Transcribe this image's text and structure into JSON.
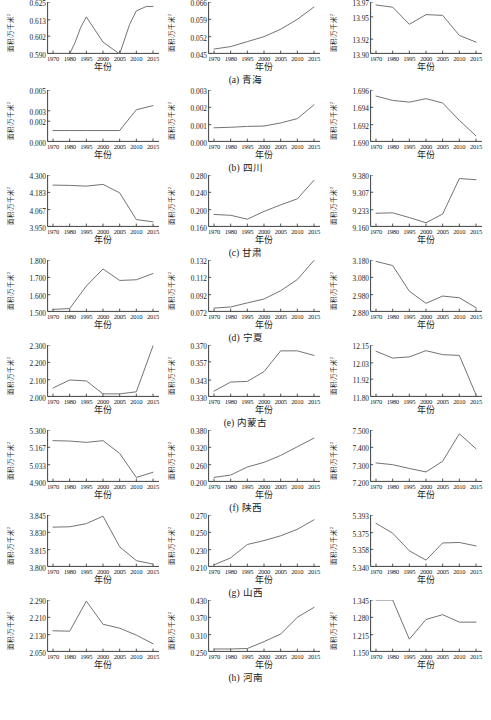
{
  "figure": {
    "axis_label_y": "面积/万千米",
    "axis_label_y_sup": "2",
    "axis_label_x": "年份",
    "line_color": "#6b6b6b",
    "axis_color": "#2b2b2b"
  },
  "chart_data": [
    {
      "type": "line",
      "panel": "a1",
      "row_caption": "(a) 青海",
      "title": "",
      "xlabel": "年份",
      "ylabel": "面积/万千米²",
      "xticks": [
        1970,
        1980,
        1995,
        2000,
        2005,
        2010,
        2015
      ],
      "yticks": [
        0.59,
        0.602,
        0.613,
        0.625
      ],
      "ytick_labels": [
        "0.590",
        "0.602",
        "0.613",
        "0.625"
      ],
      "ylim": [
        0.59,
        0.625
      ],
      "x": [
        1970,
        1980,
        1985,
        1990,
        1995,
        2000,
        2005,
        2008,
        2010,
        2013,
        2015
      ],
      "values": [
        0.59,
        0.59,
        0.598,
        0.608,
        0.615,
        0.598,
        0.59,
        0.61,
        0.619,
        0.622,
        0.622
      ]
    },
    {
      "type": "line",
      "panel": "a2",
      "row_caption": "(a) 青海",
      "title": "",
      "xlabel": "年份",
      "ylabel": "面积/万千米²",
      "xticks": [
        1970,
        1980,
        1995,
        2000,
        2005,
        2010,
        2015
      ],
      "yticks": [
        0.045,
        0.052,
        0.059,
        0.066
      ],
      "ytick_labels": [
        "0.045",
        "0.052",
        "0.059",
        "0.066"
      ],
      "ylim": [
        0.045,
        0.066
      ],
      "x": [
        1970,
        1980,
        1995,
        2000,
        2005,
        2010,
        2015
      ],
      "values": [
        0.047,
        0.048,
        0.05,
        0.052,
        0.055,
        0.059,
        0.064
      ]
    },
    {
      "type": "line",
      "panel": "a3",
      "row_caption": "(a) 青海",
      "title": "",
      "xlabel": "年份",
      "ylabel": "面积/万千米²",
      "xticks": [
        1970,
        1980,
        1995,
        2000,
        2005,
        2010,
        2015
      ],
      "yticks": [
        13.9,
        13.92,
        13.95,
        13.97
      ],
      "ytick_labels": [
        "13.90",
        "13.92",
        "13.95",
        "13.97"
      ],
      "ylim": [
        13.9,
        13.97
      ],
      "x": [
        1970,
        1980,
        1995,
        2000,
        2005,
        2010,
        2015
      ],
      "values": [
        13.966,
        13.963,
        13.94,
        13.953,
        13.952,
        13.925,
        13.916
      ]
    },
    {
      "type": "line",
      "panel": "b1",
      "row_caption": "(b) 四川",
      "title": "",
      "xlabel": "年份",
      "ylabel": "面积/万千米²",
      "xticks": [
        1970,
        1980,
        1995,
        2000,
        2005,
        2010,
        2015
      ],
      "yticks": [
        0.0,
        0.002,
        0.003,
        0.005
      ],
      "ytick_labels": [
        "0.000",
        "0.002",
        "0.003",
        "0.005"
      ],
      "ylim": [
        0.0,
        0.005
      ],
      "x": [
        1970,
        1980,
        1995,
        2000,
        2005,
        2010,
        2015
      ],
      "values": [
        0.0011,
        0.0011,
        0.0011,
        0.0011,
        0.0011,
        0.0031,
        0.0035
      ]
    },
    {
      "type": "line",
      "panel": "b2",
      "row_caption": "(b) 四川",
      "title": "",
      "xlabel": "年份",
      "ylabel": "面积/万千米²",
      "xticks": [
        1970,
        1980,
        1995,
        2000,
        2005,
        2010,
        2015
      ],
      "yticks": [
        0.0,
        0.001,
        0.002,
        0.003
      ],
      "ytick_labels": [
        "0.000",
        "0.001",
        "0.002",
        "0.003"
      ],
      "ylim": [
        0.0,
        0.003
      ],
      "x": [
        1970,
        1980,
        1995,
        2000,
        2005,
        2010,
        2015
      ],
      "values": [
        0.00082,
        0.00085,
        0.0009,
        0.00092,
        0.0011,
        0.00135,
        0.00215
      ]
    },
    {
      "type": "line",
      "panel": "b3",
      "row_caption": "(b) 四川",
      "title": "",
      "xlabel": "年份",
      "ylabel": "面积/万千米²",
      "xticks": [
        1970,
        1980,
        1995,
        2000,
        2005,
        2010,
        2015
      ],
      "yticks": [
        1.69,
        1.692,
        1.694,
        1.696
      ],
      "ytick_labels": [
        "1.690",
        "1.692",
        "1.694",
        "1.696"
      ],
      "ylim": [
        1.69,
        1.696
      ],
      "x": [
        1970,
        1980,
        1995,
        2000,
        2005,
        2010,
        2015
      ],
      "values": [
        1.6953,
        1.6948,
        1.6946,
        1.695,
        1.6945,
        1.6925,
        1.6907
      ]
    },
    {
      "type": "line",
      "panel": "c1",
      "row_caption": "(c) 甘肃",
      "title": "",
      "xlabel": "年份",
      "ylabel": "面积/万千米²",
      "xticks": [
        1970,
        1980,
        1995,
        2000,
        2005,
        2010,
        2015
      ],
      "yticks": [
        3.95,
        4.067,
        4.183,
        4.3
      ],
      "ytick_labels": [
        "3.950",
        "4.067",
        "4.183",
        "4.300"
      ],
      "ylim": [
        3.95,
        4.3
      ],
      "x": [
        1970,
        1980,
        1995,
        2000,
        2005,
        2010,
        2015
      ],
      "values": [
        4.232,
        4.23,
        4.225,
        4.237,
        4.18,
        4.0,
        3.985
      ]
    },
    {
      "type": "line",
      "panel": "c2",
      "row_caption": "(c) 甘肃",
      "title": "",
      "xlabel": "年份",
      "ylabel": "面积/万千米²",
      "xticks": [
        1970,
        1980,
        1995,
        2000,
        2005,
        2010,
        2015
      ],
      "yticks": [
        0.16,
        0.2,
        0.24,
        0.28
      ],
      "ytick_labels": [
        "0.160",
        "0.200",
        "0.240",
        "0.280"
      ],
      "ylim": [
        0.16,
        0.28
      ],
      "x": [
        1970,
        1980,
        1995,
        2000,
        2005,
        2010,
        2015
      ],
      "values": [
        0.189,
        0.187,
        0.178,
        0.196,
        0.211,
        0.225,
        0.268
      ]
    },
    {
      "type": "line",
      "panel": "c3",
      "row_caption": "(c) 甘肃",
      "title": "",
      "xlabel": "年份",
      "ylabel": "面积/万千米²",
      "xticks": [
        1970,
        1980,
        1995,
        2000,
        2005,
        2010,
        2015
      ],
      "yticks": [
        9.16,
        9.233,
        9.307,
        9.38
      ],
      "ytick_labels": [
        "9.160",
        "9.233",
        "9.307",
        "9.380"
      ],
      "ylim": [
        9.16,
        9.38
      ],
      "x": [
        1970,
        1980,
        1995,
        2000,
        2005,
        2010,
        2015
      ],
      "values": [
        9.218,
        9.22,
        9.2,
        9.178,
        9.215,
        9.365,
        9.36
      ]
    },
    {
      "type": "line",
      "panel": "d1",
      "row_caption": "(d) 宁夏",
      "title": "",
      "xlabel": "年份",
      "ylabel": "面积/万千米²",
      "xticks": [
        1970,
        1980,
        1995,
        2000,
        2005,
        2010,
        2015
      ],
      "yticks": [
        1.5,
        1.6,
        1.7,
        1.8
      ],
      "ytick_labels": [
        "1.500",
        "1.600",
        "1.700",
        "1.800"
      ],
      "ylim": [
        1.5,
        1.8
      ],
      "x": [
        1970,
        1980,
        1995,
        2000,
        2005,
        2010,
        2015
      ],
      "values": [
        1.515,
        1.52,
        1.65,
        1.748,
        1.682,
        1.686,
        1.722
      ]
    },
    {
      "type": "line",
      "panel": "d2",
      "row_caption": "(d) 宁夏",
      "title": "",
      "xlabel": "年份",
      "ylabel": "面积/万千米²",
      "xticks": [
        1970,
        1980,
        1995,
        2000,
        2005,
        2010,
        2015
      ],
      "yticks": [
        0.072,
        0.092,
        0.112,
        0.132
      ],
      "ytick_labels": [
        "0.072",
        "0.092",
        "0.112",
        "0.132"
      ],
      "ylim": [
        0.072,
        0.132
      ],
      "x": [
        1970,
        1980,
        1995,
        2000,
        2005,
        2010,
        2015
      ],
      "values": [
        0.0765,
        0.0778,
        0.0825,
        0.087,
        0.0965,
        0.1095,
        0.1315
      ]
    },
    {
      "type": "line",
      "panel": "d3",
      "row_caption": "(d) 宁夏",
      "title": "",
      "xlabel": "年份",
      "ylabel": "面积/万千米²",
      "xticks": [
        1970,
        1980,
        1995,
        2000,
        2005,
        2010,
        2015
      ],
      "yticks": [
        2.88,
        2.98,
        3.08,
        3.18
      ],
      "ytick_labels": [
        "2.880",
        "2.980",
        "3.080",
        "3.180"
      ],
      "ylim": [
        2.88,
        3.18
      ],
      "x": [
        1970,
        1980,
        1995,
        2000,
        2005,
        2010,
        2015
      ],
      "values": [
        3.172,
        3.148,
        3.0,
        2.93,
        2.972,
        2.962,
        2.905
      ]
    },
    {
      "type": "line",
      "panel": "e1",
      "row_caption": "(e) 内蒙古",
      "title": "",
      "xlabel": "年份",
      "ylabel": "面积/万千米²",
      "xticks": [
        1970,
        1980,
        1995,
        2000,
        2005,
        2010,
        2015
      ],
      "yticks": [
        2.0,
        2.1,
        2.2,
        2.3
      ],
      "ytick_labels": [
        "2.000",
        "2.100",
        "2.200",
        "2.300"
      ],
      "ylim": [
        2.0,
        2.3
      ],
      "x": [
        1970,
        1980,
        1995,
        2000,
        2005,
        2010,
        2015
      ],
      "values": [
        2.052,
        2.098,
        2.093,
        2.018,
        2.018,
        2.03,
        2.295
      ]
    },
    {
      "type": "line",
      "panel": "e2",
      "row_caption": "(e) 内蒙古",
      "title": "",
      "xlabel": "年份",
      "ylabel": "面积/万千米²",
      "xticks": [
        1970,
        1980,
        1995,
        2000,
        2005,
        2010,
        2015
      ],
      "yticks": [
        0.33,
        0.343,
        0.357,
        0.37
      ],
      "ytick_labels": [
        "0.330",
        "0.343",
        "0.357",
        "0.370"
      ],
      "ylim": [
        0.33,
        0.37
      ],
      "x": [
        1970,
        1980,
        1995,
        2000,
        2005,
        2010,
        2015
      ],
      "values": [
        0.3345,
        0.3415,
        0.342,
        0.3495,
        0.3655,
        0.3655,
        0.362
      ]
    },
    {
      "type": "line",
      "panel": "e3",
      "row_caption": "(e) 内蒙古",
      "title": "",
      "xlabel": "年份",
      "ylabel": "面积/万千米²",
      "xticks": [
        1970,
        1980,
        1995,
        2000,
        2005,
        2010,
        2015
      ],
      "yticks": [
        11.8,
        11.92,
        12.03,
        12.15
      ],
      "ytick_labels": [
        "11.80",
        "11.92",
        "12.03",
        "12.15"
      ],
      "ylim": [
        11.8,
        12.15
      ],
      "x": [
        1970,
        1980,
        1995,
        2000,
        2005,
        2010,
        2015
      ],
      "values": [
        12.108,
        12.062,
        12.07,
        12.112,
        12.085,
        12.08,
        11.815
      ]
    },
    {
      "type": "line",
      "panel": "f1",
      "row_caption": "(f) 陕西",
      "title": "",
      "xlabel": "年份",
      "ylabel": "面积/万千米²",
      "xticks": [
        1970,
        1980,
        1995,
        2000,
        2005,
        2010,
        2015
      ],
      "yticks": [
        4.9,
        5.033,
        5.167,
        5.3
      ],
      "ytick_labels": [
        "4.900",
        "5.033",
        "5.167",
        "5.300"
      ],
      "ylim": [
        4.9,
        5.3
      ],
      "x": [
        1970,
        1980,
        1995,
        2000,
        2005,
        2010,
        2015
      ],
      "values": [
        5.218,
        5.215,
        5.205,
        5.218,
        5.12,
        4.935,
        4.975
      ]
    },
    {
      "type": "line",
      "panel": "f2",
      "row_caption": "(f) 陕西",
      "title": "",
      "xlabel": "年份",
      "ylabel": "面积/万千米²",
      "xticks": [
        1970,
        1980,
        1995,
        2000,
        2005,
        2010,
        2015
      ],
      "yticks": [
        0.2,
        0.26,
        0.32,
        0.38
      ],
      "ytick_labels": [
        "0.200",
        "0.260",
        "0.320",
        "0.380"
      ],
      "ylim": [
        0.2,
        0.38
      ],
      "x": [
        1970,
        1980,
        1995,
        2000,
        2005,
        2010,
        2015
      ],
      "values": [
        0.216,
        0.224,
        0.252,
        0.268,
        0.292,
        0.322,
        0.352
      ]
    },
    {
      "type": "line",
      "panel": "f3",
      "row_caption": "(f) 陕西",
      "title": "",
      "xlabel": "年份",
      "ylabel": "面积/万千米²",
      "xticks": [
        1970,
        1980,
        1995,
        2000,
        2005,
        2010,
        2015
      ],
      "yticks": [
        7.2,
        7.3,
        7.4,
        7.5
      ],
      "ytick_labels": [
        "7.200",
        "7.300",
        "7.400",
        "7.500"
      ],
      "ylim": [
        7.2,
        7.5
      ],
      "x": [
        1970,
        1980,
        1995,
        2000,
        2005,
        2010,
        2015
      ],
      "values": [
        7.31,
        7.3,
        7.278,
        7.258,
        7.32,
        7.478,
        7.392
      ]
    },
    {
      "type": "line",
      "panel": "g1",
      "row_caption": "(g) 山西",
      "title": "",
      "xlabel": "年份",
      "ylabel": "面积/万千米²",
      "xticks": [
        1970,
        1980,
        1995,
        2000,
        2005,
        2010,
        2015
      ],
      "yticks": [
        3.8,
        3.815,
        3.83,
        3.845
      ],
      "ytick_labels": [
        "3.800",
        "3.815",
        "3.830",
        "3.845"
      ],
      "ylim": [
        3.8,
        3.845
      ],
      "x": [
        1970,
        1980,
        1995,
        2000,
        2005,
        2010,
        2015
      ],
      "values": [
        3.8345,
        3.8348,
        3.8375,
        3.844,
        3.8175,
        3.8055,
        3.8025
      ]
    },
    {
      "type": "line",
      "panel": "g2",
      "row_caption": "(g) 山西",
      "title": "",
      "xlabel": "年份",
      "ylabel": "面积/万千米²",
      "xticks": [
        1970,
        1980,
        1995,
        2000,
        2005,
        2010,
        2015
      ],
      "yticks": [
        0.21,
        0.23,
        0.25,
        0.27
      ],
      "ytick_labels": [
        "0.210",
        "0.230",
        "0.250",
        "0.270"
      ],
      "ylim": [
        0.21,
        0.27
      ],
      "x": [
        1970,
        1980,
        1995,
        2000,
        2005,
        2010,
        2015
      ],
      "values": [
        0.2125,
        0.2205,
        0.236,
        0.2405,
        0.246,
        0.2535,
        0.2645
      ]
    },
    {
      "type": "line",
      "panel": "g3",
      "row_caption": "(g) 山西",
      "title": "",
      "xlabel": "年份",
      "ylabel": "面积/万千米²",
      "xticks": [
        1970,
        1980,
        1995,
        2000,
        2005,
        2010,
        2015
      ],
      "yticks": [
        5.34,
        5.358,
        5.375,
        5.393
      ],
      "ytick_labels": [
        "5.340",
        "5.358",
        "5.375",
        "5.393"
      ],
      "ylim": [
        5.34,
        5.393
      ],
      "x": [
        1970,
        1980,
        1995,
        2000,
        2005,
        2010,
        2015
      ],
      "values": [
        5.3845,
        5.3745,
        5.3565,
        5.347,
        5.3645,
        5.365,
        5.3615
      ]
    },
    {
      "type": "line",
      "panel": "h1",
      "row_caption": "(h) 河南",
      "title": "",
      "xlabel": "年份",
      "ylabel": "面积/万千米²",
      "xticks": [
        1970,
        1980,
        1995,
        2000,
        2005,
        2010,
        2015
      ],
      "yticks": [
        2.05,
        2.13,
        2.21,
        2.29
      ],
      "ytick_labels": [
        "2.050",
        "2.130",
        "2.210",
        "2.290"
      ],
      "ylim": [
        2.05,
        2.29
      ],
      "x": [
        1970,
        1980,
        1995,
        2000,
        2005,
        2010,
        2015
      ],
      "values": [
        2.148,
        2.146,
        2.285,
        2.178,
        2.16,
        2.128,
        2.088
      ]
    },
    {
      "type": "line",
      "panel": "h2",
      "row_caption": "(h) 河南",
      "title": "",
      "xlabel": "年份",
      "ylabel": "面积/万千米²",
      "xticks": [
        1970,
        1980,
        1995,
        2000,
        2005,
        2010,
        2015
      ],
      "yticks": [
        0.25,
        0.31,
        0.37,
        0.43
      ],
      "ytick_labels": [
        "0.250",
        "0.310",
        "0.370",
        "0.430"
      ],
      "ylim": [
        0.25,
        0.43
      ],
      "x": [
        1970,
        1980,
        1995,
        2000,
        2005,
        2010,
        2015
      ],
      "values": [
        0.2605,
        0.2605,
        0.262,
        0.286,
        0.312,
        0.37,
        0.4045
      ]
    },
    {
      "type": "line",
      "panel": "h3",
      "row_caption": "(h) 河南",
      "title": "",
      "xlabel": "年份",
      "ylabel": "面积/万千米²",
      "xticks": [
        1970,
        1980,
        1995,
        2000,
        2005,
        2010,
        2015
      ],
      "yticks": [
        1.15,
        1.215,
        1.28,
        1.345
      ],
      "ytick_labels": [
        "1.150",
        "1.215",
        "1.280",
        "1.345"
      ],
      "ylim": [
        1.15,
        1.345
      ],
      "x": [
        1970,
        1980,
        1995,
        2000,
        2005,
        2010,
        2015
      ],
      "values": [
        1.345,
        1.345,
        1.198,
        1.272,
        1.29,
        1.262,
        1.262
      ]
    }
  ],
  "rows": [
    {
      "caption_index": "(a)",
      "caption_name": "青海"
    },
    {
      "caption_index": "(b)",
      "caption_name": "四川"
    },
    {
      "caption_index": "(c)",
      "caption_name": "甘肃"
    },
    {
      "caption_index": "(d)",
      "caption_name": "宁夏"
    },
    {
      "caption_index": "(e)",
      "caption_name": "内蒙古"
    },
    {
      "caption_index": "(f)",
      "caption_name": "陕西"
    },
    {
      "caption_index": "(g)",
      "caption_name": "山西"
    },
    {
      "caption_index": "(h)",
      "caption_name": "河南"
    }
  ]
}
